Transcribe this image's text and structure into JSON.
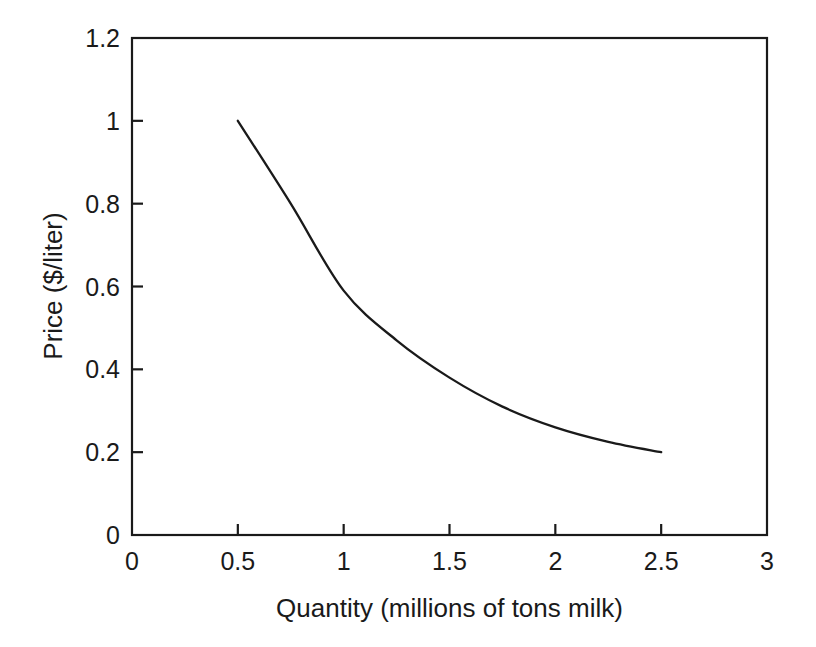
{
  "chart_data": {
    "type": "line",
    "title": "",
    "subtitle": "",
    "xlabel": "Quantity (millions of tons milk)",
    "ylabel": "Price ($/liter)",
    "xlim": [
      0,
      3
    ],
    "ylim": [
      0,
      1.2
    ],
    "xticks": [
      0,
      0.5,
      1,
      1.5,
      2,
      2.5,
      3
    ],
    "xtick_labels": [
      "0",
      "0.5",
      "1",
      "1.5",
      "2",
      "2.5",
      "3"
    ],
    "yticks": [
      0,
      0.2,
      0.4,
      0.6,
      0.8,
      1,
      1.2
    ],
    "ytick_labels": [
      "0",
      "0.2",
      "0.4",
      "0.6",
      "0.8",
      "1",
      "1.2"
    ],
    "grid": false,
    "legend": null,
    "legend_position": "none",
    "frame": "box",
    "tick_direction": "in",
    "series": [
      {
        "name": "Demand curve",
        "color": "#1a1a1a",
        "x": [
          0.5,
          0.75,
          1.0,
          1.25,
          1.5,
          1.75,
          2.0,
          2.25,
          2.5
        ],
        "values": [
          1.0,
          0.8,
          0.59,
          0.47,
          0.38,
          0.31,
          0.26,
          0.225,
          0.2
        ]
      }
    ],
    "annotations": []
  },
  "axes": {
    "x_title": "Quantity (millions of tons milk)",
    "y_title": "Price ($/liter)"
  },
  "colors": {
    "background": "#ffffff",
    "ink": "#1a1a1a",
    "curve": "#1a1a1a"
  }
}
